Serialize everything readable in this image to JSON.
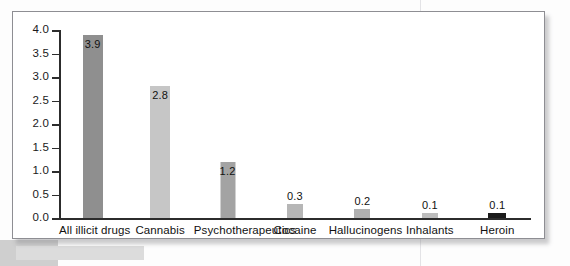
{
  "chart_data": {
    "type": "bar",
    "title": "",
    "subtitle": "",
    "xlabel": "",
    "ylabel": "",
    "ylim": [
      0.0,
      4.0
    ],
    "ytick_labels": [
      "0.0",
      "0.5",
      "1.0",
      "1.5",
      "2.0",
      "2.5",
      "3.0",
      "3.5",
      "4.0"
    ],
    "ytick_values": [
      0.0,
      0.5,
      1.0,
      1.5,
      2.0,
      2.5,
      3.0,
      3.5,
      4.0
    ],
    "grid": false,
    "legend": "none",
    "categories": [
      "All illicit drugs",
      "Cannabis",
      "Psychotherapeutics",
      "Cocaine",
      "Hallucinogens",
      "Inhalants",
      "Heroin"
    ],
    "values": [
      3.9,
      2.8,
      1.2,
      0.3,
      0.2,
      0.1,
      0.1
    ],
    "value_labels": [
      "3.9",
      "2.8",
      "1.2",
      "0.3",
      "0.2",
      "0.1",
      "0.1"
    ],
    "bar_colors": [
      "#8f8f8f",
      "#c6c6c6",
      "#a3a3a3",
      "#b6b6b6",
      "#b0b0b0",
      "#bdbdbd",
      "#1b1b1b"
    ],
    "label_inside": [
      true,
      true,
      true,
      false,
      false,
      false,
      false
    ]
  },
  "figure": {
    "frame_color": "#8e8e93",
    "axis_color": "#2c2c2c",
    "background": "#ffffff"
  }
}
